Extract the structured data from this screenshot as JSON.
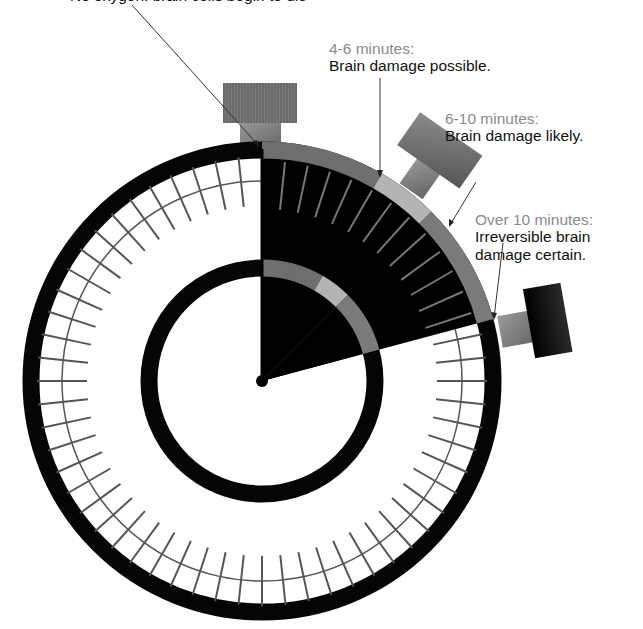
{
  "diagram": {
    "title_clipped": "No oxygen: brain cells begin to die",
    "callouts": [
      {
        "id": "0-4",
        "time": "",
        "desc": ""
      },
      {
        "id": "4-6",
        "time": "4-6 minutes:",
        "desc": "Brain damage possible."
      },
      {
        "id": "6-10",
        "time": "6-10 minutes:",
        "desc": "Brain damage likely."
      },
      {
        "id": "10+",
        "time": "Over 10 minutes:",
        "desc": "Irreversible brain damage certain."
      }
    ],
    "stopwatch": {
      "center": [
        262,
        381
      ],
      "outer_ring_radius": 232,
      "inner_ring_radius": 113,
      "tick_circle_radius": 200,
      "tick_count": 60,
      "elapsed_wedge_degrees": [
        0,
        75
      ],
      "segments": [
        {
          "name": "0-4 minutes",
          "from_deg": 0,
          "to_deg": 30,
          "color": "#6e6e6e"
        },
        {
          "name": "4-6 minutes",
          "from_deg": 30,
          "to_deg": 45,
          "color": "#b4b4b4"
        },
        {
          "name": "6-10 minutes",
          "from_deg": 45,
          "to_deg": 75,
          "color": "#7a7a7a"
        }
      ]
    },
    "colors": {
      "ring": "#050505",
      "wedge": "#000000",
      "tick": "#555555",
      "wedge_tick": "#777777",
      "leader": "#333333",
      "button_cap": "#6c6c6c",
      "button_stem": "#8a8a8a",
      "button_dark": "#111111"
    }
  }
}
